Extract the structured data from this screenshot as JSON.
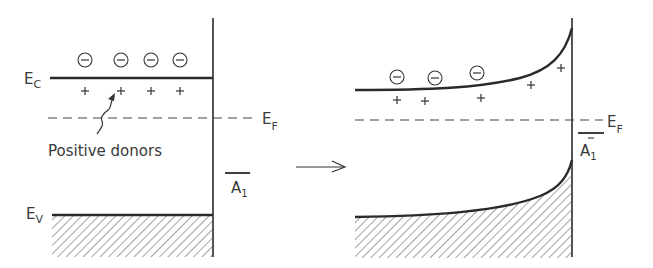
{
  "figure": {
    "left_panel": {
      "ec_label": "E",
      "ec_sub": "C",
      "ev_label": "E",
      "ev_sub": "V",
      "ef_label": "E",
      "ef_sub": "F",
      "electron_symbol": "⊖",
      "donor_symbol": "+",
      "electron_count": 4,
      "donor_count": 4,
      "annotation": "Positive donors",
      "surface_state_label": "A",
      "surface_state_sub": "1"
    },
    "transition_arrow": "→",
    "right_panel": {
      "ef_label": "E",
      "ef_sub": "F",
      "electron_symbol": "⊖",
      "donor_symbol": "+",
      "electron_count": 3,
      "donor_count": 5,
      "surface_state_label": "A",
      "surface_state_sub": "1",
      "surface_state_charge": "−"
    },
    "colors": {
      "line": "#2a2a2a",
      "text": "#3a3a3a",
      "background": "#ffffff"
    }
  }
}
